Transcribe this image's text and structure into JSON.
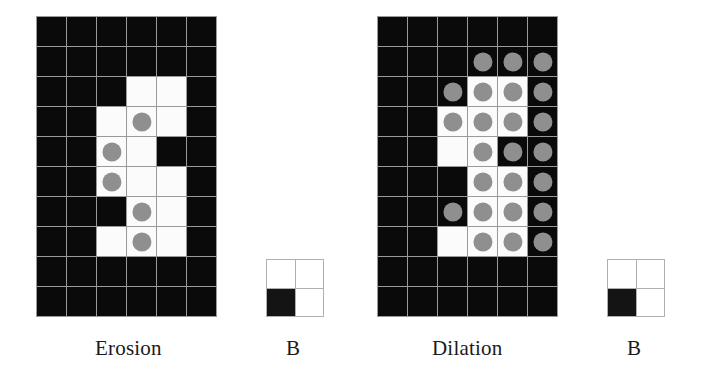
{
  "figure": {
    "colors": {
      "background": "#ffffff",
      "cell_black": "#0a0a0a",
      "cell_white": "#fbfbfb",
      "dot_gray": "#8f8f8f",
      "gridline": "#9a9a9a",
      "text": "#1a1a1a"
    }
  },
  "captions": {
    "erosion": "Erosion",
    "b_left": "B",
    "dilation": "Dilation",
    "b_right": "B"
  },
  "grids": {
    "erosion": {
      "label": "Erosion",
      "cols": 6,
      "rows": 10,
      "cell_size": 29,
      "legend": {
        "0": "black cell",
        "1": "white cell",
        "2": "white cell with gray dot",
        "3": "black cell with gray dot"
      },
      "cells": [
        [
          0,
          0,
          0,
          0,
          0,
          0
        ],
        [
          0,
          0,
          0,
          0,
          0,
          0
        ],
        [
          0,
          0,
          0,
          1,
          1,
          0
        ],
        [
          0,
          0,
          1,
          2,
          1,
          0
        ],
        [
          0,
          0,
          2,
          1,
          0,
          0
        ],
        [
          0,
          0,
          2,
          1,
          1,
          0
        ],
        [
          0,
          0,
          0,
          2,
          1,
          0
        ],
        [
          0,
          0,
          1,
          2,
          1,
          0
        ],
        [
          0,
          0,
          0,
          0,
          0,
          0
        ],
        [
          0,
          0,
          0,
          0,
          0,
          0
        ]
      ]
    },
    "dilation": {
      "label": "Dilation",
      "cols": 6,
      "rows": 10,
      "cell_size": 29,
      "legend": {
        "0": "black cell",
        "1": "white cell",
        "2": "white cell with gray dot",
        "3": "black cell with gray dot"
      },
      "cells": [
        [
          0,
          0,
          0,
          0,
          0,
          0
        ],
        [
          0,
          0,
          0,
          3,
          3,
          3
        ],
        [
          0,
          0,
          3,
          2,
          2,
          3
        ],
        [
          0,
          0,
          2,
          2,
          2,
          3
        ],
        [
          0,
          0,
          1,
          2,
          3,
          3
        ],
        [
          0,
          0,
          0,
          2,
          2,
          3
        ],
        [
          0,
          0,
          3,
          2,
          2,
          3
        ],
        [
          0,
          0,
          1,
          2,
          2,
          3
        ],
        [
          0,
          0,
          0,
          0,
          0,
          0
        ],
        [
          0,
          0,
          0,
          0,
          0,
          0
        ]
      ]
    }
  },
  "structuring_elements": {
    "b_left": {
      "label": "B",
      "cols": 2,
      "rows": 2,
      "legend": {
        "0": "white cell",
        "1": "black cell"
      },
      "cells": [
        [
          0,
          0
        ],
        [
          1,
          0
        ]
      ]
    },
    "b_right": {
      "label": "B",
      "cols": 2,
      "rows": 2,
      "legend": {
        "0": "white cell",
        "1": "black cell"
      },
      "cells": [
        [
          0,
          0
        ],
        [
          1,
          0
        ]
      ]
    }
  }
}
